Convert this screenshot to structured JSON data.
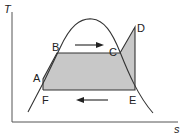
{
  "diagram": {
    "type": "T-s diagram (superheated Rankine cycle)",
    "axes": {
      "y_label": "T",
      "x_label": "s"
    },
    "points": [
      {
        "id": "A",
        "label": "A"
      },
      {
        "id": "B",
        "label": "B"
      },
      {
        "id": "C",
        "label": "C"
      },
      {
        "id": "D",
        "label": "D"
      },
      {
        "id": "E",
        "label": "E"
      },
      {
        "id": "F",
        "label": "F"
      }
    ],
    "arrows": [
      {
        "name": "heat-addition-arrow",
        "direction": "right",
        "between": [
          "B",
          "C"
        ]
      },
      {
        "name": "heat-rejection-arrow",
        "direction": "left",
        "between": [
          "E",
          "F"
        ]
      }
    ],
    "colors": {
      "line": "#333333",
      "fill": "#c8c8c8",
      "background": "#ffffff"
    }
  }
}
